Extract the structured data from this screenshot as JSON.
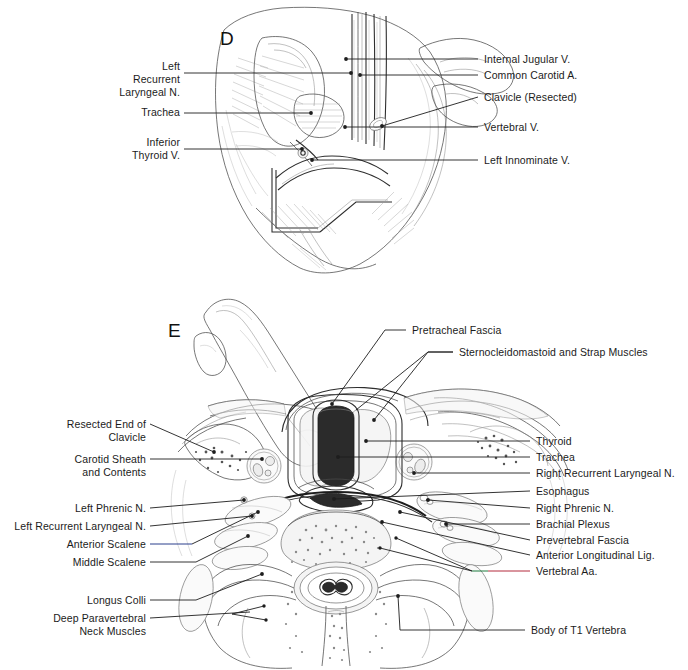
{
  "figure": {
    "background_color": "#ffffff",
    "ink_color": "#4a4a4a",
    "label_color": "#1b1b1b"
  },
  "panels": [
    {
      "id": "panel-d",
      "letter": "D",
      "caption": "Operative view of left supraclavicular exposure",
      "labels_left": [
        {
          "name": "left-recurrent-laryngeal-n",
          "text": "Left\nRecurrent\nLaryngeal N."
        },
        {
          "name": "trachea",
          "text": "Trachea"
        },
        {
          "name": "inferior-thyroid-v",
          "text": "Inferior\nThyroid V."
        }
      ],
      "labels_right": [
        {
          "name": "internal-jugular-v",
          "text": "Internal Jugular V."
        },
        {
          "name": "common-carotid-a",
          "text": "Common Carotid A."
        },
        {
          "name": "clavicle-resected",
          "text": "Clavicle (Resected)"
        },
        {
          "name": "vertebral-v",
          "text": "Vertebral V."
        },
        {
          "name": "left-innominate-v",
          "text": "Left Innominate V."
        }
      ]
    },
    {
      "id": "panel-e",
      "letter": "E",
      "caption": "Cross-sectional anatomy at the level of T1",
      "labels_top": [
        {
          "name": "pretracheal-fascia",
          "text": "Pretracheal Fascia"
        },
        {
          "name": "sternocleidomastoid-and-strap-muscles",
          "text": "Sternocleidomastoid and Strap Muscles"
        }
      ],
      "labels_left": [
        {
          "name": "resected-end-of-clavicle",
          "text": "Resected End of\nClavicle"
        },
        {
          "name": "carotid-sheath-and-contents",
          "text": "Carotid Sheath\nand Contents"
        },
        {
          "name": "left-phrenic-n",
          "text": "Left Phrenic N."
        },
        {
          "name": "left-recurrent-laryngeal-n",
          "text": "Left Recurrent Laryngeal N."
        },
        {
          "name": "anterior-scalene",
          "text": "Anterior Scalene",
          "leader_color": "#2b3f8c"
        },
        {
          "name": "middle-scalene",
          "text": "Middle Scalene"
        },
        {
          "name": "longus-colli",
          "text": "Longus Colli"
        },
        {
          "name": "deep-paravertebral-neck-muscles",
          "text": "Deep Paravertebral\nNeck Muscles"
        }
      ],
      "labels_right": [
        {
          "name": "thyroid",
          "text": "Thyroid"
        },
        {
          "name": "trachea",
          "text": "Trachea"
        },
        {
          "name": "right-recurrent-laryngeal-n",
          "text": "Right Recurrent Laryngeal N."
        },
        {
          "name": "esophagus",
          "text": "Esophagus"
        },
        {
          "name": "right-phrenic-n",
          "text": "Right Phrenic N."
        },
        {
          "name": "brachial-plexus",
          "text": "Brachial Plexus"
        },
        {
          "name": "prevertebral-fascia",
          "text": "Prevertebral Fascia"
        },
        {
          "name": "anterior-longitudinal-lig",
          "text": "Anterior Longitudinal Lig."
        },
        {
          "name": "vertebral-aa",
          "text": "Vertebral Aa.",
          "leader_color": "#b32a3c",
          "leader_color_2": "#1f7a3f"
        }
      ],
      "labels_bottom": [
        {
          "name": "body-of-t1-vertebra",
          "text": "Body of T1 Vertebra"
        }
      ]
    }
  ],
  "accents": {
    "artery_red": "#b32a3c",
    "vein_blue": "#2b3f8c",
    "nerve_green": "#1f7a3f"
  }
}
